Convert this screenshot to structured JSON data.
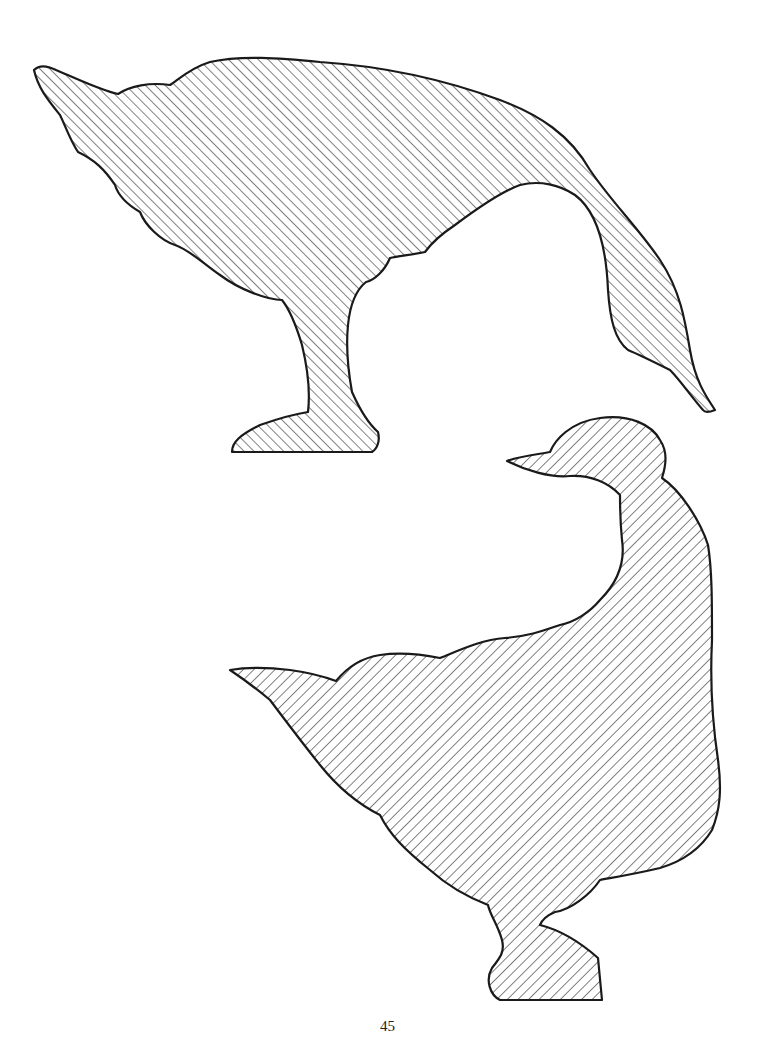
{
  "page": {
    "page_number": "45",
    "figures": [
      {
        "name": "goose-bending-down",
        "fill": "diagonal-hatch-forward",
        "outline_color": "#1a1a1a"
      },
      {
        "name": "goose-standing-looking-back",
        "fill": "diagonal-hatch-backward",
        "outline_color": "#1a1a1a"
      }
    ],
    "colors": {
      "background": "#ffffff",
      "ink": "#1a1a1a"
    }
  }
}
